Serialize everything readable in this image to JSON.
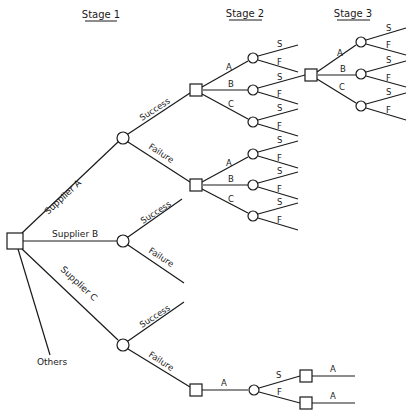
{
  "headers": {
    "stage1": "Stage 1",
    "stage2": "Stage 2",
    "stage3": "Stage 3"
  },
  "root": {
    "type": "decision",
    "branches": {
      "supplier_a": "Supplier A",
      "supplier_b": "Supplier B",
      "supplier_c": "Supplier C",
      "others": "Others"
    }
  },
  "outcomes": {
    "success": "Success",
    "failure": "Failure"
  },
  "stage2_options": {
    "a": "A",
    "b": "B",
    "c": "C"
  },
  "leaf_outcomes": {
    "s": "S",
    "f": "F"
  },
  "stage3_options": {
    "a": "A",
    "b": "B",
    "c": "C"
  },
  "supplier_c_failure_path": {
    "choice": "A",
    "s": "S",
    "f": "F",
    "after_s": "A",
    "after_f": "A"
  }
}
